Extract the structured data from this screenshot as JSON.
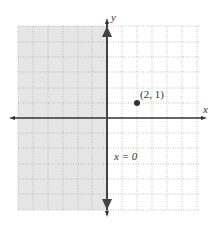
{
  "figure": {
    "axes": {
      "x_label": "x",
      "y_label": "y",
      "x_range": [
        -6,
        6
      ],
      "y_range": [
        -6,
        6
      ]
    },
    "grid": {
      "style": "dotted",
      "spacing": 1
    },
    "shaded_region": {
      "description": "x < 0 (left half-plane)",
      "color": "#e6e6e6"
    },
    "boundary_line": {
      "equation_label": "x = 0",
      "style": "solid"
    },
    "test_point": {
      "label": "(2, 1)",
      "x": 2,
      "y": 1
    }
  }
}
